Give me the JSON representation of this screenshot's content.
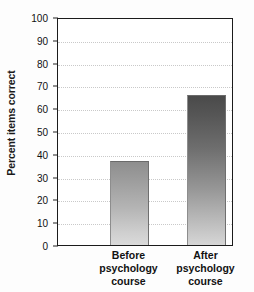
{
  "chart_data": {
    "type": "bar",
    "title": "",
    "xlabel": "",
    "ylabel": "Percent items correct",
    "categories": [
      "Before psychology course",
      "After psychology course"
    ],
    "category_lines": [
      [
        "Before",
        "psychology",
        "course"
      ],
      [
        "After",
        "psychology",
        "course"
      ]
    ],
    "values": [
      37,
      66
    ],
    "ylim": [
      0,
      100
    ],
    "ytick_values": [
      0,
      10,
      20,
      30,
      40,
      50,
      60,
      70,
      80,
      90,
      100
    ],
    "ytick_labels": [
      "0",
      "10",
      "20",
      "30",
      "40",
      "50",
      "60",
      "70",
      "80",
      "90",
      "100"
    ],
    "grid": true,
    "grid_axis": "y",
    "grid_style": "dotted",
    "legend": false,
    "bar_fill": "gradient-gray",
    "colors": {
      "bar_top_before": "#8e8e8e",
      "bar_bottom_before": "#dadada",
      "bar_top_after": "#4a4a4a",
      "bar_bottom_after": "#d6d6d6",
      "axis": "#1b1b1b",
      "grid": "#c9c9c9",
      "text": "#111111",
      "background": "#ffffff"
    }
  }
}
